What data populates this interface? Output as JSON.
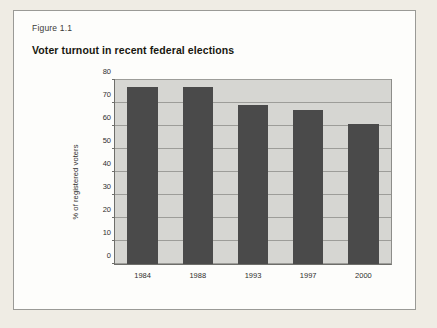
{
  "figure": {
    "label": "Figure 1.1",
    "title": "Voter turnout in recent federal elections"
  },
  "colors": {
    "page_background": "#efece4",
    "card_background": "#fdfdfb",
    "card_border": "#9a9a96",
    "plot_background": "#d6d6d2",
    "bar_fill": "#4a4a4a",
    "gridline": "#9d9d99",
    "text": "#2f2f2d"
  },
  "chart_data": {
    "type": "bar",
    "title": "Voter turnout in recent federal elections",
    "xlabel": "",
    "ylabel": "% of registered voters",
    "categories": [
      "1984",
      "1988",
      "1993",
      "1997",
      "2000"
    ],
    "values": [
      77,
      77,
      69,
      67,
      61
    ],
    "ylim": [
      0,
      80
    ],
    "yticks": [
      0,
      10,
      20,
      30,
      40,
      50,
      60,
      70,
      80
    ],
    "ytick_labels": [
      "0",
      "10",
      "20",
      "30",
      "40",
      "50",
      "60",
      "70",
      "80"
    ],
    "grid": true,
    "legend": false
  }
}
